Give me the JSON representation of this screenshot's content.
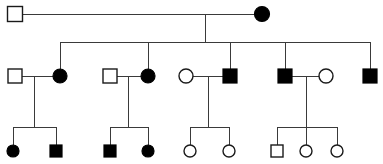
{
  "diagram": {
    "type": "pedigree-chart",
    "title": "",
    "width": 383,
    "height": 164,
    "background_color": "#ffffff",
    "line_color": "#3a3a3a",
    "symbol_outline_color": "#1a1a1a",
    "symbol_fill_affected_color": "#000000",
    "symbol_fill_unaffected_color": "#ffffff",
    "legend": {
      "square_meaning": "male",
      "circle_meaning": "female",
      "filled_meaning": "affected",
      "open_meaning": "unaffected"
    },
    "generations": [
      {
        "id": "I",
        "label": "",
        "individuals": [
          {
            "id": "I-1",
            "shape": "square",
            "status": "unaffected",
            "cx": 15,
            "cy": 14,
            "size": 15
          },
          {
            "id": "I-2",
            "shape": "circle",
            "status": "affected",
            "cx": 262,
            "cy": 14,
            "size": 15
          }
        ]
      },
      {
        "id": "II",
        "label": "",
        "individuals": [
          {
            "id": "II-1",
            "shape": "square",
            "status": "unaffected",
            "cx": 15,
            "cy": 76,
            "size": 14
          },
          {
            "id": "II-2",
            "shape": "circle",
            "status": "affected",
            "cx": 60,
            "cy": 76,
            "size": 14
          },
          {
            "id": "II-3",
            "shape": "square",
            "status": "unaffected",
            "cx": 110,
            "cy": 76,
            "size": 14
          },
          {
            "id": "II-4",
            "shape": "circle",
            "status": "affected",
            "cx": 148,
            "cy": 76,
            "size": 14
          },
          {
            "id": "II-5",
            "shape": "circle",
            "status": "unaffected",
            "cx": 186,
            "cy": 76,
            "size": 14
          },
          {
            "id": "II-6",
            "shape": "square",
            "status": "affected",
            "cx": 230,
            "cy": 76,
            "size": 14
          },
          {
            "id": "II-7",
            "shape": "square",
            "status": "affected",
            "cx": 285,
            "cy": 76,
            "size": 14
          },
          {
            "id": "II-8",
            "shape": "circle",
            "status": "unaffected",
            "cx": 326,
            "cy": 76,
            "size": 14
          },
          {
            "id": "II-9",
            "shape": "square",
            "status": "affected",
            "cx": 370,
            "cy": 76,
            "size": 14
          }
        ]
      },
      {
        "id": "III",
        "label": "",
        "individuals": [
          {
            "id": "III-1",
            "shape": "circle",
            "status": "affected",
            "cx": 13,
            "cy": 151,
            "size": 12
          },
          {
            "id": "III-2",
            "shape": "square",
            "status": "affected",
            "cx": 56,
            "cy": 151,
            "size": 12
          },
          {
            "id": "III-3",
            "shape": "square",
            "status": "affected",
            "cx": 110,
            "cy": 151,
            "size": 12
          },
          {
            "id": "III-4",
            "shape": "circle",
            "status": "affected",
            "cx": 148,
            "cy": 151,
            "size": 12
          },
          {
            "id": "III-5",
            "shape": "circle",
            "status": "unaffected",
            "cx": 190,
            "cy": 151,
            "size": 12
          },
          {
            "id": "III-6",
            "shape": "circle",
            "status": "unaffected",
            "cx": 229,
            "cy": 151,
            "size": 12
          },
          {
            "id": "III-7",
            "shape": "square",
            "status": "unaffected",
            "cx": 277,
            "cy": 151,
            "size": 12
          },
          {
            "id": "III-8",
            "shape": "circle",
            "status": "unaffected",
            "cx": 306,
            "cy": 151,
            "size": 12
          },
          {
            "id": "III-9",
            "shape": "circle",
            "status": "unaffected",
            "cx": 337,
            "cy": 151,
            "size": 12
          }
        ]
      }
    ],
    "matings": [
      {
        "id": "mating-I",
        "partners": [
          "I-1",
          "I-2"
        ],
        "y": 14,
        "x1": 23,
        "x2": 254,
        "descent_x": 205
      },
      {
        "id": "mating-II-A",
        "partners": [
          "II-1",
          "II-2"
        ],
        "y": 76,
        "x1": 22,
        "x2": 53,
        "descent_x": 34
      },
      {
        "id": "mating-II-B",
        "partners": [
          "II-3",
          "II-4"
        ],
        "y": 76,
        "x1": 117,
        "x2": 141,
        "descent_x": 128
      },
      {
        "id": "mating-II-C",
        "partners": [
          "II-5",
          "II-6"
        ],
        "y": 76,
        "x1": 193,
        "x2": 223,
        "descent_x": 208
      },
      {
        "id": "mating-II-D",
        "partners": [
          "II-7",
          "II-8"
        ],
        "y": 76,
        "x1": 292,
        "x2": 319,
        "descent_x": 306
      }
    ],
    "sibships": [
      {
        "id": "sibship-gen2",
        "parents_mating": "mating-I",
        "bar_y": 42,
        "bar_x1": 60,
        "bar_x2": 370,
        "child_drops": [
          60,
          148,
          230,
          285,
          370
        ],
        "children": [
          "II-2",
          "II-4",
          "II-6",
          "II-7",
          "II-9"
        ]
      },
      {
        "id": "sibship-gen3-A",
        "parents_mating": "mating-II-A",
        "bar_y": 127,
        "bar_x1": 13,
        "bar_x2": 56,
        "child_drops": [
          13,
          56
        ],
        "children": [
          "III-1",
          "III-2"
        ]
      },
      {
        "id": "sibship-gen3-B",
        "parents_mating": "mating-II-B",
        "bar_y": 127,
        "bar_x1": 110,
        "bar_x2": 148,
        "child_drops": [
          110,
          148
        ],
        "children": [
          "III-3",
          "III-4"
        ]
      },
      {
        "id": "sibship-gen3-C",
        "parents_mating": "mating-II-C",
        "bar_y": 127,
        "bar_x1": 190,
        "bar_x2": 229,
        "child_drops": [
          190,
          229
        ],
        "children": [
          "III-5",
          "III-6"
        ]
      },
      {
        "id": "sibship-gen3-D",
        "parents_mating": "mating-II-D",
        "bar_y": 127,
        "bar_x1": 277,
        "bar_x2": 337,
        "child_drops": [
          277,
          306,
          337
        ],
        "children": [
          "III-7",
          "III-8",
          "III-9"
        ]
      }
    ],
    "counts": {
      "total_individuals": 20,
      "affected_individuals": 10,
      "unaffected_individuals": 10,
      "generation_count": 3
    }
  }
}
